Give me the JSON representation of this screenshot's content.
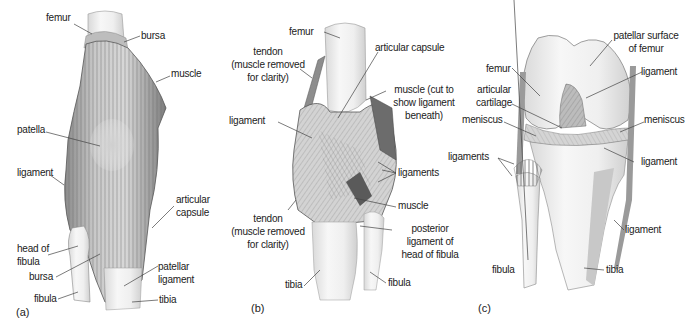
{
  "panels": [
    {
      "id": "a",
      "panel_label": "(a)",
      "view": "anterior",
      "labels": {
        "femur": "femur",
        "bursa_top": "bursa",
        "muscle": "muscle",
        "patella": "patella",
        "ligament": "ligament",
        "articular_capsule_1": "articular",
        "articular_capsule_2": "capsule",
        "head_of_fibula_1": "head of",
        "head_of_fibula_2": "fibula",
        "bursa_bottom": "bursa",
        "patellar_ligament_1": "patellar",
        "patellar_ligament_2": "ligament",
        "fibula": "fibula",
        "tibia": "tibia"
      }
    },
    {
      "id": "b",
      "panel_label": "(b)",
      "view": "posterior",
      "labels": {
        "femur": "femur",
        "tendon_top_1": "tendon",
        "tendon_top_2": "(muscle removed",
        "tendon_top_3": "for clarity)",
        "articular_capsule": "articular capsule",
        "muscle_cut_1": "muscle (cut to",
        "muscle_cut_2": "show ligament",
        "muscle_cut_3": "beneath)",
        "ligament": "ligament",
        "ligaments": "ligaments",
        "muscle": "muscle",
        "tendon_bottom_1": "tendon",
        "tendon_bottom_2": "(muscle removed",
        "tendon_bottom_3": "for clarity)",
        "posterior_ligament_1": "posterior",
        "posterior_ligament_2": "ligament of",
        "posterior_ligament_3": "head of fibula",
        "tibia": "tibia",
        "fibula": "fibula"
      }
    },
    {
      "id": "c",
      "panel_label": "(c)",
      "view": "anterior, flexed (patella removed)",
      "labels": {
        "patellar_surface_1": "patellar surface",
        "patellar_surface_2": "of femur",
        "femur": "femur",
        "ligament_top": "ligament",
        "articular_cartilage_1": "articular",
        "articular_cartilage_2": "cartilage",
        "meniscus_left": "meniscus",
        "meniscus_right": "meniscus",
        "ligaments": "ligaments",
        "ligament_mid": "ligament",
        "ligament_low": "ligament",
        "fibula": "fibula",
        "tibia": "tibia"
      }
    }
  ]
}
